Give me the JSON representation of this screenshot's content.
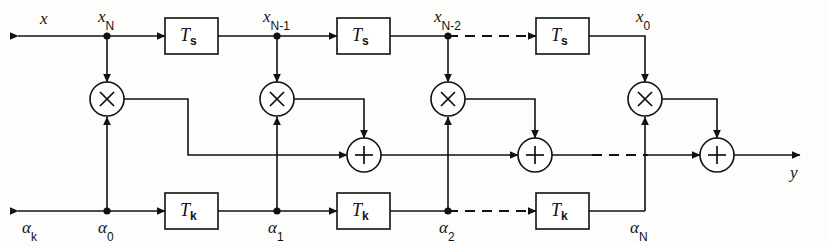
{
  "diagram": {
    "type": "block-diagram",
    "colors": {
      "line": "#111111",
      "background": "#fdfdfb",
      "fill": "#ffffff"
    },
    "signals": {
      "input_label": "x",
      "output_label": "y",
      "coefficient_input_label": "α",
      "coefficient_input_sub": "k"
    },
    "tap_labels": [
      {
        "base": "x",
        "sub": "N"
      },
      {
        "base": "x",
        "sub": "N-1"
      },
      {
        "base": "x",
        "sub": "N-2"
      },
      {
        "base": "x",
        "sub": "0"
      }
    ],
    "coefficient_labels": [
      {
        "base": "α",
        "sub": "0"
      },
      {
        "base": "α",
        "sub": "1"
      },
      {
        "base": "α",
        "sub": "2"
      },
      {
        "base": "α",
        "sub": "N"
      }
    ],
    "delay_top": {
      "label_base": "T",
      "label_sub": "s",
      "count": 3
    },
    "delay_bottom": {
      "label_base": "T",
      "label_sub": "k",
      "count": 3
    },
    "multiplier_glyph": "×",
    "adder_glyph": "+",
    "multiplier_count": 4,
    "adder_count": 3,
    "ellipsis_note": "dashed continuation"
  }
}
